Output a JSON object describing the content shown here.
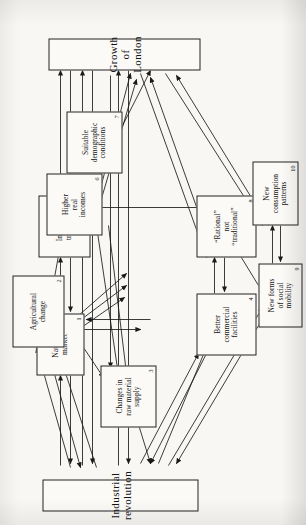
{
  "figure": {
    "orientation": "rotated-90-ccw",
    "ink_color": "#1a1a1a",
    "paper_color": "#f8f7f4"
  },
  "nodes": [
    {
      "id": "industrial-revolution",
      "label": "Industrial  revolution",
      "number": ""
    },
    {
      "id": "growth-of-london",
      "label": "Growth of London",
      "number": ""
    },
    {
      "id": "national-market",
      "label": "National\nmarket",
      "number": "1"
    },
    {
      "id": "agricultural-change",
      "label": "Agricultural\nchange",
      "number": "2"
    },
    {
      "id": "raw-material-supply",
      "label": "Changes in\nraw material\nsupply",
      "number": "3"
    },
    {
      "id": "commercial-facilities",
      "label": "Better\ncommercial\nfacilities",
      "number": "4"
    },
    {
      "id": "improved-transport",
      "label": "Improved\ntransport",
      "number": "5"
    },
    {
      "id": "higher-real-incomes",
      "label": "Higher\nreal\nincomes",
      "number": "6"
    },
    {
      "id": "demographic-conditions",
      "label": "Suitable\ndemographic\nconditions",
      "number": "7"
    },
    {
      "id": "rational-not-traditional",
      "label": "“Rational”\nnot\n“traditional”",
      "number": "8"
    },
    {
      "id": "social-mobility",
      "label": "New forms\nof social\nmobility",
      "number": "9"
    },
    {
      "id": "consumption-patterns",
      "label": "New\nconsumption\npatterns",
      "number": "10"
    }
  ],
  "caption": {
    "text": ""
  }
}
